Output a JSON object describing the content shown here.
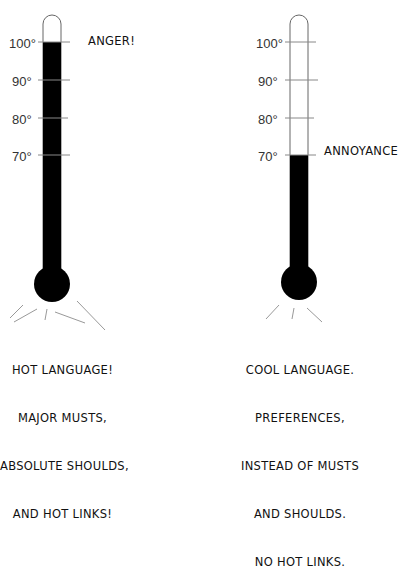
{
  "diagram": {
    "colors": {
      "fill": "#000000",
      "outline": "#555555",
      "tick": "#777777",
      "ray": "#888888",
      "text": "#111111"
    },
    "scale_labels": [
      "100°",
      "90°",
      "80°",
      "70°"
    ],
    "thermometers": [
      {
        "id": "left",
        "level_label": "ANGER!",
        "fill_level": "100°",
        "caption_lines": [
          "HOT LANGUAGE!",
          "MAJOR MUSTS,",
          "ABSOLUTE SHOULDS,",
          "AND HOT LINKS!"
        ]
      },
      {
        "id": "right",
        "level_label": "ANNOYANCE",
        "fill_level": "70°",
        "caption_lines": [
          "COOL LANGUAGE.",
          "PREFERENCES,",
          "INSTEAD OF MUSTS",
          "AND SHOULDS.",
          "NO HOT LINKS."
        ]
      }
    ]
  }
}
